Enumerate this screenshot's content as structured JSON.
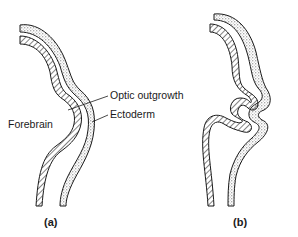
{
  "figure": {
    "panel_a": {
      "caption": "(a)",
      "labels": {
        "optic_outgrowth": "Optic outgrowth",
        "ectoderm": "Ectoderm",
        "forebrain": "Forebrain"
      }
    },
    "panel_b": {
      "caption": "(b)"
    },
    "colors": {
      "ink": "#1a1a1a",
      "background": "#ffffff"
    }
  }
}
